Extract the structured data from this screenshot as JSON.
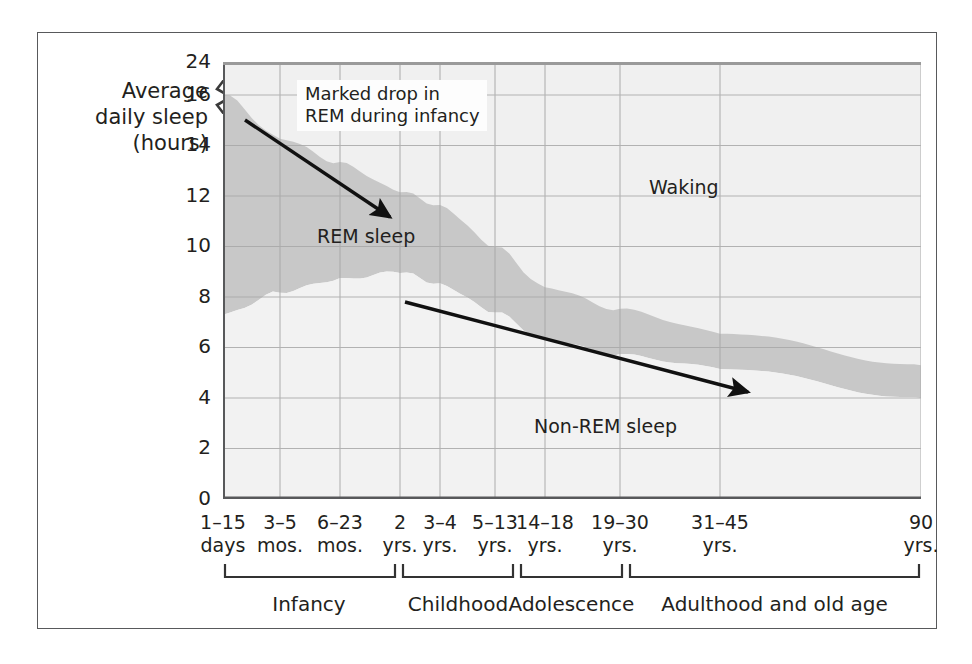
{
  "chart_data": {
    "type": "area",
    "title": "",
    "ylabel": "Average daily sleep (hours)",
    "xlabel": "",
    "ylim": [
      0,
      24
    ],
    "grid": true,
    "axis_break": {
      "between": [
        16,
        24
      ],
      "note": "y-axis compressed between 16 and 24"
    },
    "yticks": [
      "24",
      "16",
      "14",
      "12",
      "10",
      "8",
      "6",
      "4",
      "2",
      "0"
    ],
    "ytick_values": [
      24,
      16,
      14,
      12,
      10,
      8,
      6,
      4,
      2,
      0
    ],
    "categories": [
      {
        "line1": "1–15",
        "line2": "days"
      },
      {
        "line1": "3–5",
        "line2": "mos."
      },
      {
        "line1": "6–23",
        "line2": "mos."
      },
      {
        "line1": "2",
        "line2": "yrs."
      },
      {
        "line1": "3–4",
        "line2": "yrs."
      },
      {
        "line1": "5–13",
        "line2": "yrs."
      },
      {
        "line1": "14–18",
        "line2": "yrs."
      },
      {
        "line1": "19–30",
        "line2": "yrs."
      },
      {
        "line1": "31–45",
        "line2": "yrs."
      },
      {
        "line1": "90",
        "line2": "yrs."
      }
    ],
    "series": [
      {
        "name": "Total sleep",
        "description": "upper boundary of REM band (total daily sleep)",
        "x_labels": [
          "1–15 days",
          "3–5 mos.",
          "6–23 mos.",
          "2 yrs.",
          "3–4 yrs.",
          "5–13 yrs.",
          "14–18 yrs.",
          "19–30 yrs.",
          "31–45 yrs.",
          "90 yrs."
        ],
        "values": [
          16.0,
          14.3,
          13.3,
          12.2,
          11.6,
          10.0,
          8.4,
          7.5,
          6.6,
          5.3
        ]
      },
      {
        "name": "Non-REM sleep",
        "description": "lower boundary of REM band (non-REM portion)",
        "x_labels": [
          "1–15 days",
          "3–5 mos.",
          "6–23 mos.",
          "2 yrs.",
          "3–4 yrs.",
          "5–13 yrs.",
          "14–18 yrs.",
          "19–30 yrs.",
          "31–45 yrs.",
          "90 yrs."
        ],
        "values": [
          7.3,
          8.2,
          8.7,
          9.0,
          8.5,
          7.4,
          6.3,
          5.7,
          5.2,
          4.0
        ]
      },
      {
        "name": "REM sleep",
        "description": "band between total sleep and non-REM sleep",
        "x_labels": [
          "1–15 days",
          "3–5 mos.",
          "6–23 mos.",
          "2 yrs.",
          "3–4 yrs.",
          "5–13 yrs.",
          "14–18 yrs.",
          "19–30 yrs.",
          "31–45 yrs.",
          "90 yrs."
        ],
        "values": [
          8.7,
          6.1,
          4.6,
          3.2,
          3.1,
          2.6,
          2.1,
          1.8,
          1.4,
          1.3
        ]
      }
    ],
    "region_labels": [
      {
        "name": "waking",
        "text": "Waking"
      },
      {
        "name": "rem",
        "text": "REM sleep"
      },
      {
        "name": "nonrem",
        "text": "Non-REM sleep"
      }
    ],
    "annotations": [
      {
        "name": "marked-drop-callout",
        "line1": "Marked drop in",
        "line2": "REM during infancy",
        "arrow": "points from callout down-right to the REM band boundary near 2 yrs."
      },
      {
        "name": "nonrem-trend-arrow",
        "arrow": "long arrow from about 8 hours at 2 yrs. down-right to about 4.5 hours near 45 yrs."
      }
    ],
    "stage_brackets": [
      {
        "label": "Infancy"
      },
      {
        "label": "Childhood"
      },
      {
        "label": "Adolescence"
      },
      {
        "label": "Adulthood and old age"
      }
    ],
    "colors": {
      "rem_band": "#c8c8c8",
      "nonrem_band": "#f2f2f2",
      "waking_band": "#f0f0f0",
      "grid": "#a8a8a8",
      "axis": "#58595b",
      "text": "#231f20"
    }
  },
  "ylabel_lines": {
    "l1": "Average",
    "l2": "daily sleep",
    "l3": "(hours)"
  }
}
